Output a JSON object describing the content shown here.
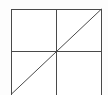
{
  "figure": {
    "title": "",
    "canvas": {
      "width": 108,
      "height": 95,
      "background_color": "#fdfdfd"
    },
    "style": {
      "stroke_color": "#4a4a4a",
      "stroke_width": 1,
      "fill_color": "#ffffff"
    },
    "square": {
      "left": 11,
      "top": 9,
      "right": 101,
      "bottom": 94,
      "bottom_clipped": true
    },
    "shapes": [
      {
        "name": "square-outline",
        "kind": "rect",
        "x": 11,
        "y": 9,
        "width": 90,
        "height": 85
      },
      {
        "name": "vertical-midline",
        "kind": "line",
        "x1": 56,
        "y1": 9,
        "x2": 56,
        "y2": 94
      },
      {
        "name": "horizontal-midline",
        "kind": "line",
        "x1": 11,
        "y1": 51,
        "x2": 101,
        "y2": 51
      },
      {
        "name": "diagonal-line",
        "kind": "line",
        "x1": 11,
        "y1": 94,
        "x2": 101,
        "y2": 9
      }
    ],
    "quadrants": [
      {
        "name": "top-left-quadrant",
        "x": 11,
        "y": 9,
        "width": 45,
        "height": 42,
        "shaded": false
      },
      {
        "name": "top-right-quadrant",
        "x": 56,
        "y": 9,
        "width": 45,
        "height": 42,
        "shaded": false
      },
      {
        "name": "bottom-left-quadrant",
        "x": 11,
        "y": 51,
        "width": 45,
        "height": 43,
        "shaded": false
      },
      {
        "name": "bottom-right-quadrant",
        "x": 56,
        "y": 51,
        "width": 45,
        "height": 43,
        "shaded": false
      }
    ],
    "labels": []
  }
}
